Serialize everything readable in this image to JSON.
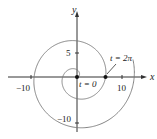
{
  "figure": {
    "type": "parametric-spiral",
    "equations": "x = t cos t, y = t sin t",
    "axes": {
      "x_label": "x",
      "y_label": "y",
      "x_ticks": [
        {
          "value": -10,
          "label": "−10"
        },
        {
          "value": 10,
          "label": "10"
        }
      ],
      "y_ticks": [
        {
          "value": 5,
          "label": "5"
        },
        {
          "value": -10,
          "label": "−10"
        }
      ]
    },
    "annotations": [
      {
        "label": "t = 0",
        "point": [
          0,
          0
        ]
      },
      {
        "label": "t = 2π",
        "point": [
          6.283,
          0
        ]
      }
    ],
    "curve_color": "#777777",
    "axis_color": "#333333"
  }
}
